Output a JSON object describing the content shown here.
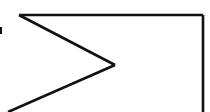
{
  "figure": {
    "canvas": {
      "width": 210,
      "height": 112,
      "background_color": "#ffffff"
    },
    "style": {
      "stroke_color": "#111111",
      "stroke_width": 2.6,
      "line_cap": "butt",
      "line_join": "miter"
    },
    "vertices": {
      "top_left_corner": {
        "x": 19,
        "y": 15
      },
      "top_right_corner": {
        "x": 203,
        "y": 15
      },
      "chevron_apex": {
        "x": 115,
        "y": 65
      },
      "vertical_line_bottom": {
        "x": 203,
        "y": 112
      },
      "lower_diagonal_end": {
        "x": 8,
        "y": 112
      }
    },
    "shapes": [
      {
        "name": "top-horizontal-line",
        "kind": "line",
        "points": "19,15 203,15"
      },
      {
        "name": "right-vertical-line",
        "kind": "line",
        "points": "203,15 203,112"
      },
      {
        "name": "upper-diagonal-line",
        "kind": "line",
        "points": "19,15 115,65"
      },
      {
        "name": "lower-diagonal-line",
        "kind": "line",
        "points": "115,65 8,112"
      },
      {
        "name": "left-edge-tick-mark",
        "kind": "rect",
        "x": 0,
        "y": 27,
        "width": 2,
        "height": 7
      }
    ]
  }
}
